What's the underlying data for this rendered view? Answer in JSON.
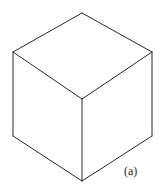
{
  "figure": {
    "panel_label": "(a)",
    "shape_name": "cube",
    "line_color": "#2b2b2b",
    "fill_color": "#ffffff",
    "background_color": "#ffffff",
    "line_width": 1,
    "canvas": {
      "width": 163,
      "height": 190
    },
    "vertices": {
      "top_apex": {
        "x": 82,
        "y": 13
      },
      "left_top": {
        "x": 13,
        "y": 52
      },
      "right_top": {
        "x": 152,
        "y": 52
      },
      "center": {
        "x": 82,
        "y": 99
      },
      "left_bottom": {
        "x": 13,
        "y": 136
      },
      "right_bottom": {
        "x": 152,
        "y": 136
      },
      "bottom_center": {
        "x": 82,
        "y": 181
      }
    },
    "faces": [
      {
        "name": "top-face",
        "points": "82,13 13,52 82,99 152,52"
      },
      {
        "name": "left-face",
        "points": "13,52 13,136 82,181 82,99"
      },
      {
        "name": "right-face",
        "points": "82,99 82,181 152,136 152,52"
      }
    ],
    "edges": [
      {
        "name": "edge-apex-to-left-top",
        "d": "M 82 13 L 13 52"
      },
      {
        "name": "edge-apex-to-right-top",
        "d": "M 82 13 L 152 52"
      },
      {
        "name": "edge-left-top-to-center",
        "d": "M 13 52 L 82 99"
      },
      {
        "name": "edge-right-top-to-center",
        "d": "M 152 52 L 82 99"
      },
      {
        "name": "edge-left-vertical",
        "d": "M 13 52 L 13 136"
      },
      {
        "name": "edge-right-vertical",
        "d": "M 152 52 L 152 136"
      },
      {
        "name": "edge-center-vertical",
        "d": "M 82 99 L 82 181"
      },
      {
        "name": "edge-left-bottom-to-bottom-center",
        "d": "M 13 136 L 82 181"
      },
      {
        "name": "edge-right-bottom-to-bottom-center",
        "d": "M 152 136 L 82 181"
      }
    ]
  }
}
